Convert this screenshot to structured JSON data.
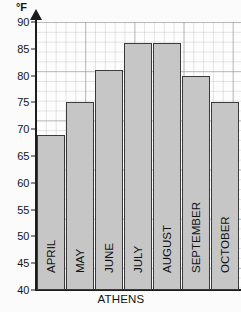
{
  "chart_data": {
    "type": "bar",
    "title": "",
    "caption": "ATHENS",
    "xlabel": "ATHENS",
    "ylabel": "°F",
    "unit_label": "°F",
    "categories": [
      "APRIL",
      "MAY",
      "JUNE",
      "JULY",
      "AUGUST",
      "SEPTEMBER",
      "OCTOBER"
    ],
    "values": [
      69,
      75,
      81,
      86,
      86,
      80,
      75
    ],
    "ylim": [
      40,
      90
    ],
    "ytick_step": 5,
    "yticks": [
      40,
      45,
      50,
      55,
      60,
      65,
      70,
      75,
      80,
      85,
      90
    ],
    "ytick_labels": [
      "40",
      "45",
      "50",
      "55",
      "60",
      "65",
      "70",
      "75",
      "80",
      "85",
      "90"
    ],
    "grid": true,
    "grid_style": "graph-paper",
    "legend": false,
    "bar_fill": "#c6c6c6",
    "bar_border": "#3a3a3a",
    "axis_color": "#1c1c1c",
    "background": "#fdfdfd",
    "label_orientation": "vertical-inside-bar"
  },
  "axis": {
    "unit": "°F",
    "arrow": "up-arrow-icon"
  }
}
